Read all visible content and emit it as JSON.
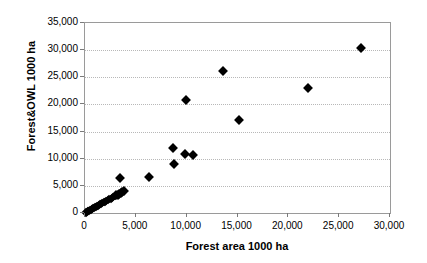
{
  "chart_data": {
    "type": "scatter",
    "title": "",
    "xlabel": "Forest area 1000 ha",
    "ylabel": "Forest&OWL 1000 ha",
    "xlim": [
      0,
      30000
    ],
    "ylim": [
      0,
      35000
    ],
    "xticks": [
      0,
      5000,
      10000,
      15000,
      20000,
      25000,
      30000
    ],
    "yticks": [
      0,
      5000,
      10000,
      15000,
      20000,
      25000,
      30000,
      35000
    ],
    "xtick_labels": [
      "0",
      "5,000",
      "10,000",
      "15,000",
      "20,000",
      "25,000",
      "30,000"
    ],
    "ytick_labels": [
      "0",
      "5,000",
      "10,000",
      "15,000",
      "20,000",
      "25,000",
      "30,000",
      "35,000"
    ],
    "grid": "horizontal-dotted",
    "legend": "none",
    "marker": "filled-diamond",
    "marker_color": "#000000",
    "points": [
      [
        60,
        60
      ],
      [
        120,
        130
      ],
      [
        180,
        200
      ],
      [
        250,
        280
      ],
      [
        320,
        360
      ],
      [
        400,
        430
      ],
      [
        480,
        520
      ],
      [
        560,
        600
      ],
      [
        640,
        700
      ],
      [
        720,
        790
      ],
      [
        800,
        860
      ],
      [
        880,
        950
      ],
      [
        960,
        1030
      ],
      [
        1040,
        1120
      ],
      [
        1150,
        1230
      ],
      [
        1260,
        1340
      ],
      [
        1370,
        1460
      ],
      [
        1480,
        1570
      ],
      [
        1600,
        1700
      ],
      [
        1720,
        1830
      ],
      [
        1850,
        1960
      ],
      [
        1980,
        2090
      ],
      [
        2100,
        2230
      ],
      [
        2240,
        2370
      ],
      [
        2380,
        2510
      ],
      [
        2520,
        2650
      ],
      [
        2660,
        2800
      ],
      [
        2800,
        2950
      ],
      [
        2950,
        3100
      ],
      [
        3080,
        3250
      ],
      [
        3220,
        3400
      ],
      [
        3360,
        3550
      ],
      [
        3500,
        3700
      ],
      [
        3650,
        3850
      ],
      [
        3800,
        3980
      ],
      [
        3400,
        6500
      ],
      [
        6250,
        6700
      ],
      [
        8650,
        12050
      ],
      [
        8750,
        8950
      ],
      [
        9800,
        10850
      ],
      [
        10600,
        10700
      ],
      [
        9900,
        20800
      ],
      [
        13600,
        26100
      ],
      [
        15100,
        17100
      ],
      [
        21900,
        22950
      ],
      [
        27100,
        30450
      ]
    ]
  }
}
